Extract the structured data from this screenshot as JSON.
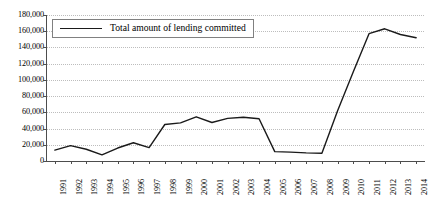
{
  "chart_data": {
    "type": "line",
    "title": "",
    "xlabel": "",
    "ylabel": "",
    "grid": true,
    "legend_position": "top-left-inside",
    "ylim": [
      0,
      180000
    ],
    "ytick_labels": [
      "180,000",
      "160,000",
      "140,000",
      "120,000",
      "100,000",
      "80,000",
      "60,000",
      "40,000",
      "20,000",
      "0"
    ],
    "ytick_values": [
      180000,
      160000,
      140000,
      120000,
      100000,
      80000,
      60000,
      40000,
      20000,
      0
    ],
    "categories": [
      "1991",
      "1992",
      "1993",
      "1994",
      "1995",
      "1996",
      "1997",
      "1998",
      "1999",
      "2000",
      "2001",
      "2002",
      "2003",
      "2004",
      "2005",
      "2006",
      "2007",
      "2008",
      "2009",
      "2010",
      "2011",
      "2012",
      "2013",
      "2014"
    ],
    "series": [
      {
        "name": "Total amount of lending committed",
        "color": "#1a1a1a",
        "values": [
          13500,
          19000,
          14500,
          7500,
          16000,
          22500,
          16500,
          45000,
          47000,
          54500,
          47500,
          52500,
          54000,
          52000,
          11500,
          11000,
          10000,
          9500,
          62000,
          110000,
          157000,
          163000,
          156000,
          152000
        ]
      }
    ],
    "legend": [
      {
        "label": "Total amount of lending committed",
        "color": "#1a1a1a"
      }
    ]
  },
  "axis": {
    "line_color": "#4d4d4d",
    "grid_color": "#bdbdbd"
  }
}
